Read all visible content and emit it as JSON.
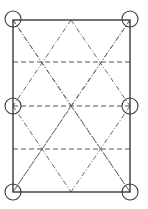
{
  "diagram": {
    "type": "triangular-lattice-in-rectangle",
    "canvas": {
      "width": 148,
      "height": 209
    },
    "frame": {
      "x1": 13,
      "y1": 20,
      "x2": 130,
      "y2": 192
    },
    "horizontal_dashed_lines_y": [
      62,
      106,
      149
    ],
    "diagonal_dashdot_lines": [
      [
        13,
        20,
        130,
        192
      ],
      [
        130,
        20,
        13,
        192
      ],
      [
        71,
        20,
        13,
        106
      ],
      [
        71,
        20,
        130,
        106
      ],
      [
        13,
        106,
        71,
        192
      ],
      [
        130,
        106,
        71,
        192
      ],
      [
        13,
        20,
        71,
        106
      ],
      [
        130,
        20,
        71,
        106
      ],
      [
        71,
        106,
        13,
        192
      ],
      [
        71,
        106,
        130,
        192
      ]
    ],
    "circle_nodes": [
      {
        "cx": 13,
        "cy": 19,
        "r": 8,
        "label": "top-left"
      },
      {
        "cx": 130,
        "cy": 19,
        "r": 8,
        "label": "top-right"
      },
      {
        "cx": 13,
        "cy": 106,
        "r": 8,
        "label": "middle-left"
      },
      {
        "cx": 130,
        "cy": 106,
        "r": 8,
        "label": "middle-right"
      },
      {
        "cx": 13,
        "cy": 192,
        "r": 8,
        "label": "bottom-left"
      },
      {
        "cx": 130,
        "cy": 192,
        "r": 8,
        "label": "bottom-right"
      }
    ],
    "colors": {
      "frame": "#3a3a3a",
      "dashed": "#555555",
      "dashdot": "#6a6a6a",
      "background": "#ffffff"
    }
  }
}
